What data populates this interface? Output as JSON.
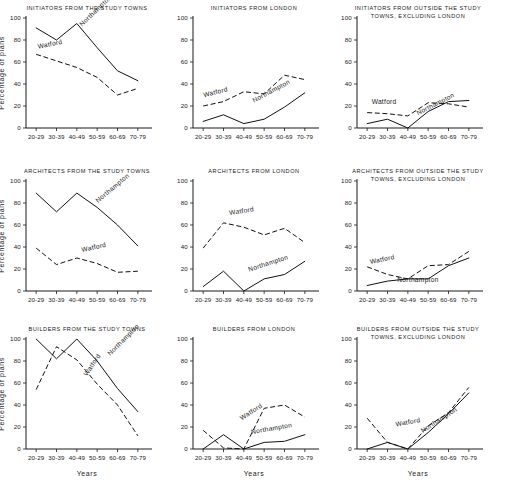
{
  "figure": {
    "axis_label_y": "Percentage of plans",
    "axis_label_x": "Years",
    "categories": [
      "20-29",
      "30-39",
      "40-49",
      "50-59",
      "60-69",
      "70-79"
    ],
    "y_ticks": [
      "0",
      "20",
      "40",
      "60",
      "80",
      "100"
    ],
    "series_names": [
      "Watford",
      "Northampton"
    ]
  },
  "chart_data": [
    {
      "type": "line",
      "title": "INITIATORS FROM THE STUDY TOWNS",
      "title_lines": [
        "INITIATORS FROM THE STUDY TOWNS"
      ],
      "xlabel": "",
      "ylabel": "Percentage of plans",
      "categories": [
        "20-29",
        "30-39",
        "40-49",
        "50-59",
        "60-69",
        "70-79"
      ],
      "ylim": [
        0,
        100
      ],
      "grid": false,
      "legend": "inline-labels",
      "series": [
        {
          "name": "Northampton",
          "style": "solid",
          "values": [
            91,
            80,
            95,
            73,
            52,
            43
          ]
        },
        {
          "name": "Watford",
          "style": "dashed",
          "values": [
            67,
            61,
            55,
            46,
            30,
            36
          ]
        }
      ]
    },
    {
      "type": "line",
      "title": "INITIATORS FROM LONDON",
      "title_lines": [
        "INITIATORS FROM LONDON"
      ],
      "xlabel": "",
      "ylabel": "",
      "categories": [
        "20-29",
        "30-39",
        "40-49",
        "50-59",
        "60-69",
        "70-79"
      ],
      "ylim": [
        0,
        100
      ],
      "grid": false,
      "legend": "inline-labels",
      "series": [
        {
          "name": "Northampton",
          "style": "solid",
          "values": [
            6,
            12,
            4,
            8,
            19,
            32
          ]
        },
        {
          "name": "Watford",
          "style": "dashed",
          "values": [
            20,
            24,
            33,
            31,
            48,
            44
          ]
        }
      ]
    },
    {
      "type": "line",
      "title": "INITIATORS FROM OUTSIDE THE STUDY TOWNS, EXCLUDING LONDON",
      "title_lines": [
        "INITIATORS FROM OUTSIDE THE STUDY",
        "TOWNS, EXCLUDING LONDON"
      ],
      "xlabel": "",
      "ylabel": "",
      "categories": [
        "20-29",
        "30-39",
        "40-49",
        "50-59",
        "60-69",
        "70-79"
      ],
      "ylim": [
        0,
        100
      ],
      "grid": false,
      "legend": "inline-labels",
      "series": [
        {
          "name": "Northampton",
          "style": "solid",
          "values": [
            4,
            8,
            0,
            15,
            24,
            25
          ]
        },
        {
          "name": "Watford",
          "style": "dashed",
          "values": [
            14,
            13,
            11,
            23,
            22,
            19
          ]
        }
      ]
    },
    {
      "type": "line",
      "title": "ARCHITECTS FROM THE STUDY TOWNS",
      "title_lines": [
        "ARCHITECTS FROM THE STUDY TOWNS"
      ],
      "xlabel": "",
      "ylabel": "Percentage of plans",
      "categories": [
        "20-29",
        "30-39",
        "40-49",
        "50-59",
        "60-69",
        "70-79"
      ],
      "ylim": [
        0,
        100
      ],
      "grid": false,
      "legend": "inline-labels",
      "series": [
        {
          "name": "Northampton",
          "style": "solid",
          "values": [
            89,
            72,
            89,
            76,
            60,
            41
          ]
        },
        {
          "name": "Watford",
          "style": "dashed",
          "values": [
            39,
            24,
            30,
            25,
            17,
            18
          ]
        }
      ]
    },
    {
      "type": "line",
      "title": "ARCHITECTS FROM LONDON",
      "title_lines": [
        "ARCHITECTS  FROM  LONDON"
      ],
      "xlabel": "",
      "ylabel": "",
      "categories": [
        "20-29",
        "30-39",
        "40-49",
        "50-59",
        "60-69",
        "70-79"
      ],
      "ylim": [
        0,
        100
      ],
      "grid": false,
      "legend": "inline-labels",
      "series": [
        {
          "name": "Northampton",
          "style": "solid",
          "values": [
            4,
            18,
            0,
            11,
            15,
            27
          ]
        },
        {
          "name": "Watford",
          "style": "dashed",
          "values": [
            39,
            62,
            58,
            51,
            57,
            44
          ]
        }
      ]
    },
    {
      "type": "line",
      "title": "ARCHITECTS FROM OUTSIDE THE STUDY TOWNS, EXCLUDING LONDON",
      "title_lines": [
        "ARCHITECTS FROM OUTSIDE THE STUDY",
        "TOWNS, EXCLUDING  LONDON"
      ],
      "xlabel": "",
      "ylabel": "",
      "categories": [
        "20-29",
        "30-39",
        "40-49",
        "50-59",
        "60-69",
        "70-79"
      ],
      "ylim": [
        0,
        100
      ],
      "grid": false,
      "legend": "inline-labels",
      "series": [
        {
          "name": "Northampton",
          "style": "solid",
          "values": [
            5,
            9,
            11,
            11,
            23,
            30
          ]
        },
        {
          "name": "Watford",
          "style": "dashed",
          "values": [
            22,
            15,
            11,
            23,
            24,
            36
          ]
        }
      ]
    },
    {
      "type": "line",
      "title": "BUILDERS FROM THE STUDY TOWNS",
      "title_lines": [
        "BUILDERS FROM THE STUDY TOWNS"
      ],
      "xlabel": "Years",
      "ylabel": "Percentage of plans",
      "categories": [
        "20-29",
        "30-39",
        "40-49",
        "50-59",
        "60-69",
        "70-79"
      ],
      "ylim": [
        0,
        100
      ],
      "grid": false,
      "legend": "inline-labels",
      "series": [
        {
          "name": "Northampton",
          "style": "solid",
          "values": [
            100,
            82,
            100,
            80,
            55,
            34
          ]
        },
        {
          "name": "Watford",
          "style": "dashed",
          "values": [
            54,
            93,
            81,
            59,
            40,
            12
          ]
        }
      ]
    },
    {
      "type": "line",
      "title": "BUILDERS FROM LONDON",
      "title_lines": [
        "BUILDERS  FROM  LONDON"
      ],
      "xlabel": "Years",
      "ylabel": "",
      "categories": [
        "20-29",
        "30-39",
        "40-49",
        "50-59",
        "60-69",
        "70-79"
      ],
      "ylim": [
        0,
        100
      ],
      "grid": false,
      "legend": "inline-labels",
      "series": [
        {
          "name": "Northampton",
          "style": "solid",
          "values": [
            0,
            13,
            0,
            6,
            7,
            13
          ]
        },
        {
          "name": "Watford",
          "style": "dashed",
          "values": [
            17,
            1,
            0,
            37,
            40,
            29
          ]
        }
      ]
    },
    {
      "type": "line",
      "title": "BUILDERS FROM OUTSIDE THE STUDY TOWNS, EXCLUDING LONDON",
      "title_lines": [
        "BUILDERS FROM OUTSIDE THE STUDY",
        "TOWNS, EXCLUDING  LONDON"
      ],
      "xlabel": "Years",
      "ylabel": "",
      "categories": [
        "20-29",
        "30-39",
        "40-49",
        "50-59",
        "60-69",
        "70-79"
      ],
      "ylim": [
        0,
        100
      ],
      "grid": false,
      "legend": "inline-labels",
      "series": [
        {
          "name": "Northampton",
          "style": "solid",
          "values": [
            0,
            6,
            0,
            15,
            32,
            51
          ]
        },
        {
          "name": "Watford",
          "style": "dashed",
          "values": [
            28,
            6,
            0,
            21,
            33,
            56
          ]
        }
      ]
    }
  ],
  "series_label_positions": [
    {
      "panel": 0,
      "Watford": {
        "x": 0.1,
        "y": 0.72,
        "rot": -12
      },
      "Northampton": {
        "x": 0.46,
        "y": 0.92,
        "rot": -44
      }
    },
    {
      "panel": 1,
      "Watford": {
        "x": 0.09,
        "y": 0.28,
        "rot": -14
      },
      "Northampton": {
        "x": 0.5,
        "y": 0.23,
        "rot": -28
      }
    },
    {
      "panel": 2,
      "Watford": {
        "x": 0.12,
        "y": 0.215,
        "rot": 0
      },
      "Northampton": {
        "x": 0.5,
        "y": 0.115,
        "rot": -27
      }
    },
    {
      "panel": 3,
      "Watford": {
        "x": 0.46,
        "y": 0.355,
        "rot": -12
      },
      "Northampton": {
        "x": 0.59,
        "y": 0.8,
        "rot": -40
      }
    },
    {
      "panel": 4,
      "Watford": {
        "x": 0.3,
        "y": 0.69,
        "rot": -9
      },
      "Northampton": {
        "x": 0.46,
        "y": 0.175,
        "rot": -18
      }
    },
    {
      "panel": 5,
      "Watford": {
        "x": 0.11,
        "y": 0.245,
        "rot": -12
      },
      "Northampton": {
        "x": 0.33,
        "y": 0.085,
        "rot": 0
      }
    },
    {
      "panel": 6,
      "Watford": {
        "x": 0.5,
        "y": 0.66,
        "rot": -56
      },
      "Northampton": {
        "x": 0.69,
        "y": 0.845,
        "rot": -45
      }
    },
    {
      "panel": 7,
      "Watford": {
        "x": 0.4,
        "y": 0.26,
        "rot": -33
      },
      "Northampton": {
        "x": 0.48,
        "y": 0.135,
        "rot": -10
      }
    },
    {
      "panel": 8,
      "Watford": {
        "x": 0.32,
        "y": 0.205,
        "rot": -10
      },
      "Northampton": {
        "x": 0.54,
        "y": 0.145,
        "rot": -33
      }
    }
  ]
}
